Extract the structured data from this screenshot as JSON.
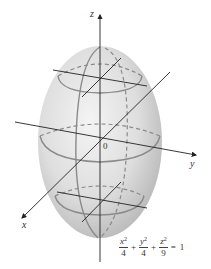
{
  "figure": {
    "type": "ellipsoid-3d-plot",
    "axes": {
      "x_label": "x",
      "y_label": "y",
      "z_label": "z",
      "origin_label": "0"
    },
    "equation": {
      "terms": [
        {
          "variable": "x",
          "exponent": "2",
          "denominator": "4"
        },
        {
          "variable": "y",
          "exponent": "2",
          "denominator": "4"
        },
        {
          "variable": "z",
          "exponent": "2",
          "denominator": "9"
        }
      ],
      "plus": "+",
      "equals": "=",
      "rhs": "1"
    },
    "colors": {
      "surface_light": "#f2f2f2",
      "surface_dark": "#bdbdbd",
      "trace_line": "#8a8a8a",
      "axis_line": "#333333"
    }
  }
}
